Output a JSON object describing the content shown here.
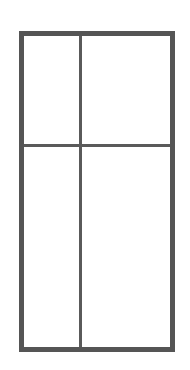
{
  "drawing": {
    "title": "Frame Elevation",
    "canvas": {
      "width": 190,
      "height": 370,
      "background": "#ffffff"
    },
    "colors": {
      "frame_stroke": "#555555",
      "mullion_stroke": "#5a5a5a",
      "pane_fill": "#ffffff",
      "background": "#ffffff"
    },
    "frame": {
      "label": "Outer frame",
      "x": 19,
      "y": 31,
      "width": 156,
      "height": 321,
      "stroke_width": 5
    },
    "dividers": [
      {
        "name": "vertical-mullion",
        "label": "Vertical mullion",
        "orientation": "vertical",
        "position": 80,
        "thickness": 3,
        "from": 31,
        "to": 352
      },
      {
        "name": "horizontal-transom",
        "label": "Horizontal transom",
        "orientation": "horizontal",
        "position": 145,
        "thickness": 3,
        "from": 19,
        "to": 175
      }
    ],
    "panes": [
      {
        "name": "pane-top-left",
        "label": "Top left pane",
        "x": 24,
        "y": 36,
        "width": 56,
        "height": 109
      },
      {
        "name": "pane-top-right",
        "label": "Top right pane",
        "x": 83,
        "y": 36,
        "width": 87,
        "height": 109
      },
      {
        "name": "pane-bottom-left",
        "label": "Bottom left pane",
        "x": 24,
        "y": 148,
        "width": 56,
        "height": 199
      },
      {
        "name": "pane-bottom-right",
        "label": "Bottom right pane",
        "x": 83,
        "y": 148,
        "width": 87,
        "height": 199
      }
    ]
  }
}
